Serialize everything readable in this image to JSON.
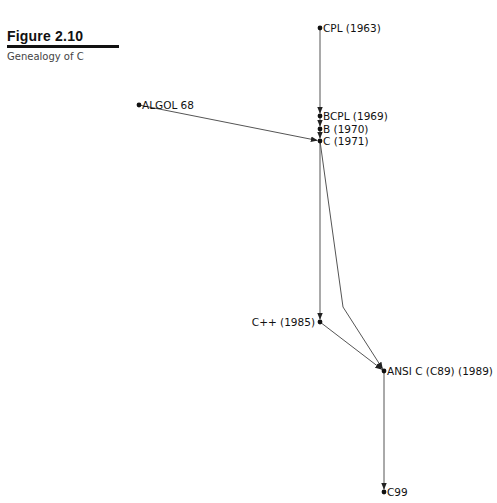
{
  "figure": {
    "label": "Figure 2.10",
    "caption": "Genealogy of C"
  },
  "nodes": [
    {
      "id": "cpl",
      "label": "CPL (1963)",
      "x": 320,
      "y": 28,
      "label_side": "right"
    },
    {
      "id": "algol68",
      "label": "ALGOL 68",
      "x": 139,
      "y": 105,
      "label_side": "right"
    },
    {
      "id": "bcpl",
      "label": "BCPL (1969)",
      "x": 320,
      "y": 116,
      "label_side": "right"
    },
    {
      "id": "b",
      "label": "B (1970)",
      "x": 320,
      "y": 129,
      "label_side": "right"
    },
    {
      "id": "c",
      "label": "C (1971)",
      "x": 320,
      "y": 141,
      "label_side": "right"
    },
    {
      "id": "cpp",
      "label": "C++ (1985)",
      "x": 320,
      "y": 322,
      "label_side": "left"
    },
    {
      "id": "ansic",
      "label": "ANSI C (C89) (1989)",
      "x": 384,
      "y": 371,
      "label_side": "right"
    },
    {
      "id": "c99",
      "label": "C99",
      "x": 384,
      "y": 492,
      "label_side": "right"
    }
  ],
  "edges": [
    {
      "from": "cpl",
      "to": "bcpl"
    },
    {
      "from": "bcpl",
      "to": "b"
    },
    {
      "from": "b",
      "to": "c"
    },
    {
      "from": "algol68",
      "to": "c"
    },
    {
      "from": "c",
      "to": "cpp"
    },
    {
      "from": "c",
      "to": "ansic",
      "via": [
        343,
        307
      ]
    },
    {
      "from": "cpp",
      "to": "ansic"
    },
    {
      "from": "ansic",
      "to": "c99"
    }
  ],
  "colors": {
    "line": "#555555",
    "node": "#111111",
    "text": "#111111"
  }
}
